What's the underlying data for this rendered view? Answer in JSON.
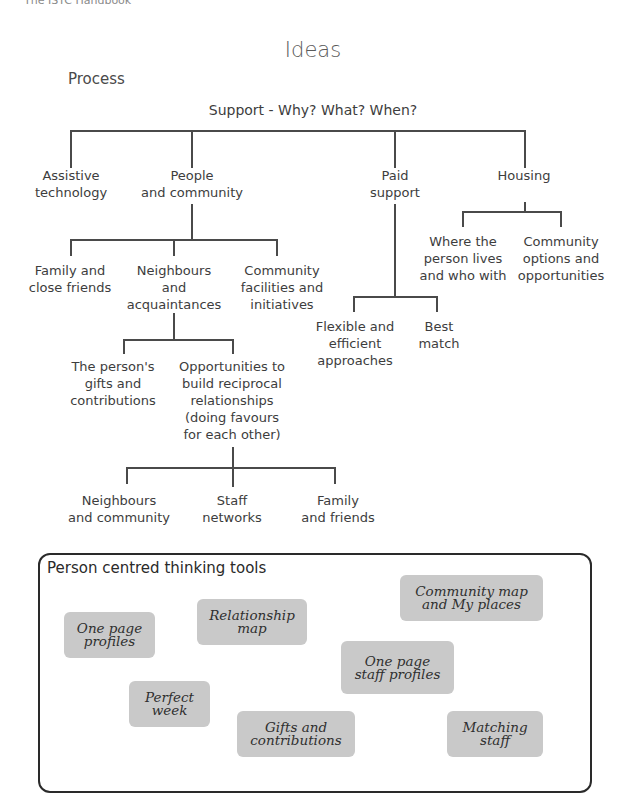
{
  "running_header": "The ISTC Handbook",
  "title": "Ideas",
  "subtitle": "Process",
  "tree": {
    "root": "Support - Why? What? When?",
    "level1": [
      {
        "id": "assistive",
        "label": "Assistive\ntechnology"
      },
      {
        "id": "people",
        "label": "People\nand community"
      },
      {
        "id": "paid",
        "label": "Paid\nsupport"
      },
      {
        "id": "housing",
        "label": "Housing"
      }
    ],
    "people_children": [
      {
        "label": "Family and\nclose friends"
      },
      {
        "label": "Neighbours\nand\nacquaintances"
      },
      {
        "label": "Community\nfacilities and\ninitiatives"
      }
    ],
    "neighbours_children": [
      {
        "label": "The person's\ngifts and\ncontributions"
      },
      {
        "label": "Opportunities to\nbuild reciprocal\nrelationships\n(doing favours\nfor each other)"
      }
    ],
    "opportunities_children": [
      {
        "label": "Neighbours\nand community"
      },
      {
        "label": "Staff\nnetworks"
      },
      {
        "label": "Family\nand friends"
      }
    ],
    "paid_children": [
      {
        "label": "Flexible and\nefficient\napproaches"
      },
      {
        "label": "Best\nmatch"
      }
    ],
    "housing_children": [
      {
        "label": "Where the\nperson lives\nand who with"
      },
      {
        "label": "Community\noptions and\nopportunities"
      }
    ]
  },
  "tools": {
    "title": "Person centred thinking tools",
    "cards": [
      {
        "label": "One page\nprofiles"
      },
      {
        "label": "Relationship\nmap"
      },
      {
        "label": "Community map\nand My places"
      },
      {
        "label": "One page\nstaff profiles"
      },
      {
        "label": "Perfect\nweek"
      },
      {
        "label": "Gifts and\ncontributions"
      },
      {
        "label": "Matching\nstaff"
      }
    ]
  },
  "colors": {
    "text": "#3d3d3d",
    "lines": "#4a4a4a",
    "card_bg": "#c9c9c9",
    "box_border": "#2a2a2a"
  }
}
